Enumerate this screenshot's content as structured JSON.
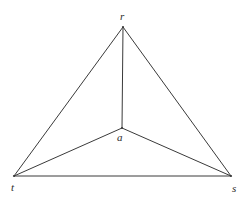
{
  "figure": {
    "type": "graph-diagram",
    "background_color": "#ffffff",
    "line_color": "#3a3a3a",
    "label_color": "#2b2b2b",
    "width": 252,
    "height": 205,
    "nodes": [
      {
        "id": "r",
        "label": "r",
        "x": 123,
        "y": 27,
        "label_x": 120,
        "label_y": 11
      },
      {
        "id": "a",
        "label": "a",
        "x": 122,
        "y": 128,
        "label_x": 117,
        "label_y": 132
      },
      {
        "id": "t",
        "label": "t",
        "x": 14,
        "y": 176,
        "label_x": 11,
        "label_y": 182
      },
      {
        "id": "s",
        "label": "s",
        "x": 231,
        "y": 176,
        "label_x": 232,
        "label_y": 183
      }
    ],
    "edges": [
      {
        "id": "edge-r-t",
        "from": "r",
        "to": "t"
      },
      {
        "id": "edge-r-s",
        "from": "r",
        "to": "s"
      },
      {
        "id": "edge-t-s",
        "from": "t",
        "to": "s"
      },
      {
        "id": "edge-a-r",
        "from": "a",
        "to": "r"
      },
      {
        "id": "edge-a-t",
        "from": "a",
        "to": "t"
      },
      {
        "id": "edge-a-s",
        "from": "a",
        "to": "s"
      }
    ]
  }
}
